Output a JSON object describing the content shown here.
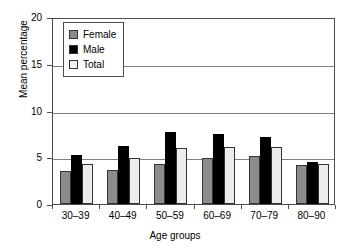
{
  "chart_data": {
    "type": "bar",
    "title": "",
    "xlabel": "Age groups",
    "ylabel": "Mean percentage",
    "categories": [
      "30–39",
      "40–49",
      "50–59",
      "60–69",
      "70–79",
      "80–90"
    ],
    "series": [
      {
        "name": "Female",
        "color": "#8c8c8c",
        "values": [
          3.5,
          3.6,
          4.3,
          4.9,
          5.1,
          4.2
        ]
      },
      {
        "name": "Male",
        "color": "#000000",
        "values": [
          5.2,
          6.2,
          7.7,
          7.5,
          7.2,
          4.5
        ]
      },
      {
        "name": "Total",
        "color": "#ececec",
        "values": [
          4.3,
          4.9,
          6.0,
          6.1,
          6.1,
          4.3
        ]
      }
    ],
    "ylim": [
      0,
      20
    ],
    "yticks": [
      0,
      5,
      10,
      15,
      20
    ],
    "ytick_labels": [
      "0",
      "5",
      "10",
      "15",
      "20"
    ],
    "grid": true,
    "legend_position": "top-left"
  }
}
